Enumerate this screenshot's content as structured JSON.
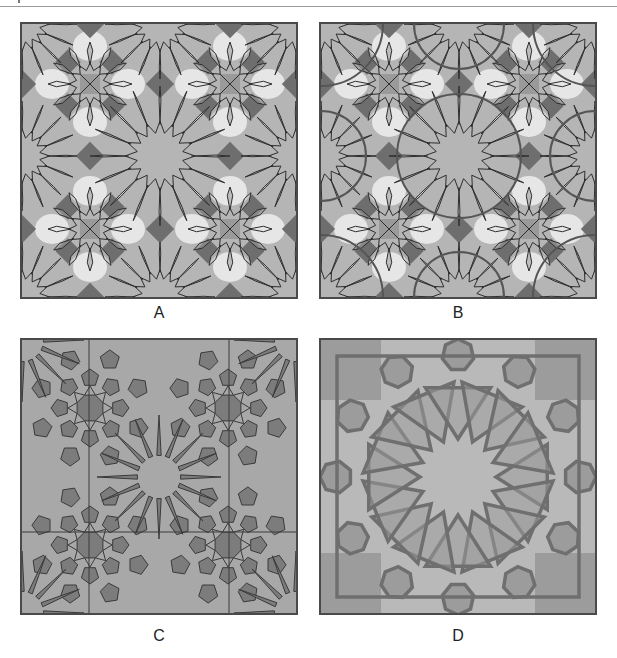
{
  "figure": {
    "panels": [
      {
        "id": "A",
        "label": "A",
        "style": "overlap-light",
        "bg": "#b5b5b5",
        "line": "#2e2e2e",
        "light": "#e6e6e6",
        "dark": "#6e6e6e",
        "mid": "#9a9a9a"
      },
      {
        "id": "B",
        "label": "B",
        "style": "overlap-circles",
        "bg": "#b5b5b5",
        "line": "#2e2e2e",
        "light": "#e6e6e6",
        "dark": "#6e6e6e",
        "mid": "#9a9a9a"
      },
      {
        "id": "C",
        "label": "C",
        "style": "dense-star",
        "bg": "#a8a8a8",
        "line": "#3a3a3a",
        "fill": "#7c7c7c"
      },
      {
        "id": "D",
        "label": "D",
        "style": "interlace-star16",
        "bg": "#b9b9b9",
        "band": "#6f6f6f",
        "fill": "#9c9c9c"
      }
    ]
  }
}
